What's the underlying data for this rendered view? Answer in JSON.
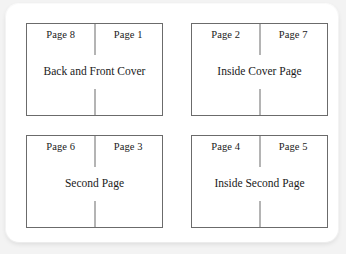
{
  "diagram": {
    "sheet_border_color": "#6b6b6b",
    "text_color": "#1a1a1a",
    "card_background": "#ffffff",
    "page_background": "#f3f3f3",
    "sheets": [
      {
        "position": "top-left",
        "left_page_label": "Page 8",
        "right_page_label": "Page 1",
        "caption": "Back and Front Cover"
      },
      {
        "position": "top-right",
        "left_page_label": "Page 2",
        "right_page_label": "Page 7",
        "caption": "Inside Cover Page"
      },
      {
        "position": "bottom-left",
        "left_page_label": "Page 6",
        "right_page_label": "Page 3",
        "caption": "Second Page"
      },
      {
        "position": "bottom-right",
        "left_page_label": "Page 4",
        "right_page_label": "Page 5",
        "caption": "Inside Second Page"
      }
    ]
  }
}
